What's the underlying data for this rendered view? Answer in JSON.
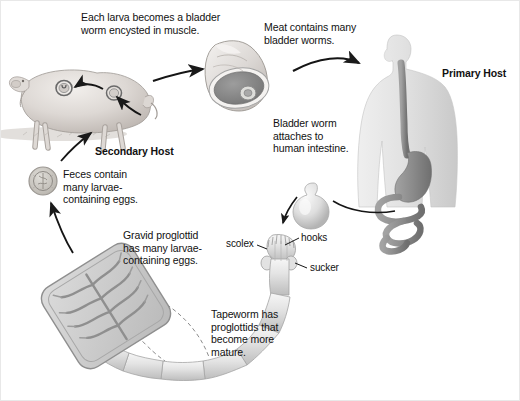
{
  "diagram": {
    "background_color": "#ffffff",
    "text_color": "#111111",
    "line_color": "#1a1a1a"
  },
  "labels": {
    "larva_encysted": "Each larva becomes a bladder\nworm encysted in muscle.",
    "meat_contains": "Meat contains many\nbladder worms.",
    "primary_host": "Primary Host",
    "secondary_host": "Secondary Host",
    "bladder_attaches": "Bladder worm\nattaches to\nhuman intestine.",
    "feces_contain": "Feces contain\nmany larvae-\ncontaining eggs.",
    "gravid_proglottid": "Gravid proglottid\nhas many larvae-\ncontaining eggs.",
    "tapeworm_proglottids": "Tapeworm has\nproglottids that\nbecome more\nmature.",
    "scolex": "scolex",
    "hooks": "hooks",
    "sucker": "sucker"
  },
  "figures": {
    "pig": "pig-secondary-host",
    "meat_cut": "meat-cross-section-with-bladder-worm",
    "human": "human-torso-primary-host",
    "stomach": "stomach-organ",
    "esophagus": "esophagus-organ",
    "intestine": "intestine-organ",
    "bladder_worm": "bladder-worm",
    "scolex_head": "tapeworm-scolex-head",
    "tapeworm_body": "tapeworm-segmented-body",
    "proglottid": "gravid-proglottid-magnified",
    "egg": "larvae-containing-egg",
    "cyst_a": "muscle-cyst-upper",
    "cyst_b": "muscle-cyst-lower"
  },
  "palette": {
    "organ_gray": "#8e8e8e",
    "organ_dark": "#7a7a7a",
    "body_light": "#e6e6e6",
    "body_mid": "#d2d2d2",
    "pig_light": "#e4e0dd",
    "pig_mid": "#cfc9c5",
    "meat_rim": "#f2f0ee",
    "meat_flesh": "#9a9a9a",
    "worm_light": "#e9e9e9",
    "worm_mid": "#cccccc",
    "proglottid_fill": "#cfcfcf",
    "proglottid_branch": "#9a9a9a"
  }
}
